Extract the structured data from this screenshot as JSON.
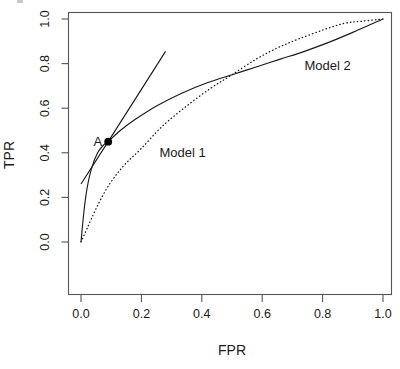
{
  "figure": {
    "kind": "roc-curve-plot",
    "background_color": "#ffffff",
    "ink_color": "#1a1a1a",
    "frame_color": "#555555"
  },
  "axes": {
    "x_title": "FPR",
    "y_title": "TPR",
    "x_ticks": [
      "0.0",
      "0.2",
      "0.4",
      "0.6",
      "0.8",
      "1.0"
    ],
    "y_ticks": [
      "0.0",
      "0.2",
      "0.4",
      "0.6",
      "0.8",
      "1.0"
    ]
  },
  "annotations": {
    "point_a_label": "A",
    "model1_label": "Model 1",
    "model2_label": "Model 2"
  },
  "chart_data": {
    "type": "line",
    "title": "",
    "xlabel": "FPR",
    "ylabel": "TPR",
    "xlim": [
      0.0,
      1.0
    ],
    "ylim": [
      0.0,
      1.0
    ],
    "xticks": [
      0.0,
      0.2,
      0.4,
      0.6,
      0.8,
      1.0
    ],
    "yticks": [
      0.0,
      0.2,
      0.4,
      0.6,
      0.8,
      1.0
    ],
    "grid": false,
    "legend_position": "inline-annotations",
    "annotations": [
      {
        "text": "A",
        "x": 0.07,
        "y": 0.45,
        "kind": "point-label"
      },
      {
        "text": "Model 1",
        "x": 0.26,
        "y": 0.4,
        "kind": "series-label"
      },
      {
        "text": "Model 2",
        "x": 0.74,
        "y": 0.79,
        "kind": "series-label"
      }
    ],
    "points": [
      {
        "label": "A",
        "x": 0.09,
        "y": 0.45,
        "marker": "filled-circle"
      }
    ],
    "series": [
      {
        "name": "Model 1",
        "style": "dotted",
        "x": [
          0.0,
          0.02,
          0.05,
          0.09,
          0.14,
          0.2,
          0.27,
          0.35,
          0.43,
          0.5,
          0.58,
          0.65,
          0.72,
          0.8,
          0.87,
          0.93,
          1.0
        ],
        "values": [
          0.0,
          0.06,
          0.15,
          0.25,
          0.34,
          0.42,
          0.52,
          0.61,
          0.69,
          0.75,
          0.82,
          0.87,
          0.91,
          0.95,
          0.98,
          0.99,
          1.0
        ]
      },
      {
        "name": "Model 2",
        "style": "solid",
        "x": [
          0.0,
          0.01,
          0.02,
          0.035,
          0.055,
          0.075,
          0.09,
          0.13,
          0.18,
          0.25,
          0.33,
          0.42,
          0.5,
          0.58,
          0.66,
          0.74,
          0.82,
          0.9,
          1.0
        ],
        "values": [
          0.0,
          0.14,
          0.24,
          0.33,
          0.4,
          0.435,
          0.45,
          0.5,
          0.55,
          0.61,
          0.665,
          0.715,
          0.75,
          0.785,
          0.82,
          0.855,
          0.895,
          0.94,
          1.0
        ]
      },
      {
        "name": "tangent-line",
        "style": "solid-straight",
        "x": [
          0.0,
          0.09,
          0.28
        ],
        "values": [
          0.26,
          0.45,
          0.855
        ]
      }
    ]
  }
}
